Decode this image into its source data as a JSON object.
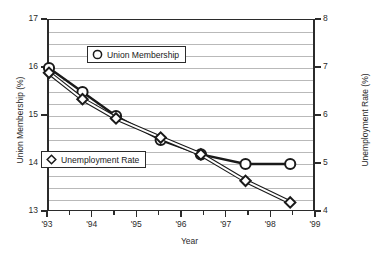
{
  "chart_data": {
    "type": "line",
    "title": "",
    "xlabel": "Year",
    "ylabel": "Union Membership (%)",
    "y2label": "Unemployment Rate (%)",
    "ylim": [
      13,
      17
    ],
    "y2lim": [
      4,
      8
    ],
    "xlim": [
      1993,
      1999
    ],
    "grid": true,
    "legend_position": "inside",
    "left_axis_ticks": [
      "13",
      "14",
      "15",
      "16",
      "17"
    ],
    "left_axis_tick_values": [
      13,
      14,
      15,
      16,
      17
    ],
    "right_axis_ticks": [
      "4",
      "5",
      "6",
      "7",
      "8"
    ],
    "right_axis_tick_values": [
      4,
      5,
      6,
      7,
      8
    ],
    "x_tick_labels": [
      "'93",
      "'94",
      "'95",
      "'96",
      "'97",
      "'98",
      "'99"
    ],
    "x_tick_values": [
      1993,
      1994,
      1995,
      1996,
      1997,
      1998,
      1999
    ],
    "series": [
      {
        "name": "Union Membership",
        "axis": "left",
        "marker": "circle",
        "color": "#1a1a1a",
        "x": [
          1993.0,
          1993.75,
          1994.5,
          1995.5,
          1996.4,
          1997.4,
          1998.4
        ],
        "values": [
          16.0,
          15.5,
          15.0,
          14.5,
          14.2,
          14.0,
          14.0
        ]
      },
      {
        "name": "Unemployment Rate",
        "axis": "right",
        "marker": "diamond",
        "color": "#1a1a1a",
        "x": [
          1993.0,
          1993.75,
          1994.5,
          1995.5,
          1996.4,
          1997.4,
          1998.4
        ],
        "values": [
          6.9,
          6.35,
          5.95,
          5.55,
          5.2,
          4.65,
          4.2
        ]
      }
    ]
  },
  "legend": {
    "union": {
      "label": "Union Membership",
      "marker_icon": "circle-marker-icon"
    },
    "unemployment": {
      "label": "Unemployment Rate",
      "marker_icon": "diamond-marker-icon"
    }
  },
  "axes": {
    "left_title": "Union Membership (%)",
    "right_title": "Unemployment Rate (%)",
    "bottom_title": "Year"
  },
  "colors": {
    "axis": "#2b2b2b",
    "grid": "#b9b9b9",
    "series": "#1a1a1a",
    "background": "#ffffff"
  }
}
